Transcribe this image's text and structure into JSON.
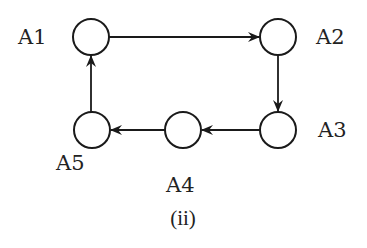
{
  "diagram": {
    "caption": "(ii)",
    "nodes": [
      {
        "id": "A1",
        "label": "A1"
      },
      {
        "id": "A2",
        "label": "A2"
      },
      {
        "id": "A3",
        "label": "A3"
      },
      {
        "id": "A4",
        "label": "A4"
      },
      {
        "id": "A5",
        "label": "A5"
      }
    ],
    "edges": [
      {
        "from": "A1",
        "to": "A2"
      },
      {
        "from": "A2",
        "to": "A3"
      },
      {
        "from": "A3",
        "to": "A4"
      },
      {
        "from": "A4",
        "to": "A5"
      },
      {
        "from": "A5",
        "to": "A1"
      }
    ]
  }
}
